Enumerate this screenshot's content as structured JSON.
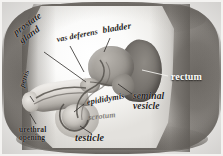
{
  "figure": {
    "kind": "anatomical-diagram",
    "style": "hand-drawn pencil / grayscale textbook illustration"
  },
  "palette": {
    "background": "#f2f1ef",
    "body_dark": "#7d7974",
    "body_mid": "#bdbab5",
    "field_light": "#fbfbfa",
    "organ_bladder": "#9e9a94",
    "organ_rectum": "#76726d",
    "organ_testicle": "#c3bfb9",
    "label_dark": "#1d1b19",
    "label_light": "#fdfdfc",
    "leader_line": "#3a3835"
  },
  "labels": [
    {
      "id": "prostate-gland",
      "text_line1": "prostate",
      "text_line2": "gland",
      "tone": "dark"
    },
    {
      "id": "vas-deferens",
      "text_line1": "vas deferens",
      "text_line2": "",
      "tone": "dark"
    },
    {
      "id": "bladder",
      "text_line1": "bladder",
      "text_line2": "",
      "tone": "dark"
    },
    {
      "id": "rectum",
      "text_line1": "rectum",
      "text_line2": "",
      "tone": "light"
    },
    {
      "id": "seminal-vesicle",
      "text_line1": "seminal",
      "text_line2": "vesicle",
      "tone": "dark"
    },
    {
      "id": "epididymis",
      "text_line1": "epididymis",
      "text_line2": "",
      "tone": "dark"
    },
    {
      "id": "scrotum",
      "text_line1": "scrotum",
      "text_line2": "",
      "tone": "faded"
    },
    {
      "id": "testicle",
      "text_line1": "testicle",
      "text_line2": "",
      "tone": "dark"
    },
    {
      "id": "penis",
      "text_line1": "penis",
      "text_line2": "",
      "tone": "dark"
    },
    {
      "id": "urethral-opening",
      "text_line1": "urethral",
      "text_line2": "opening",
      "tone": "dark"
    }
  ],
  "label_text": {
    "prostate_l1": "prostate",
    "prostate_l2": "gland",
    "vas_deferens": "vas deferens",
    "bladder": "bladder",
    "rectum": "rectum",
    "seminal_l1": "seminal",
    "seminal_l2": "vesicle",
    "epididymis": "epididymis",
    "scrotum": "scrotum",
    "testicle": "testicle",
    "penis": "penis",
    "urethral_l1": "urethral",
    "urethral_l2": "opening"
  }
}
